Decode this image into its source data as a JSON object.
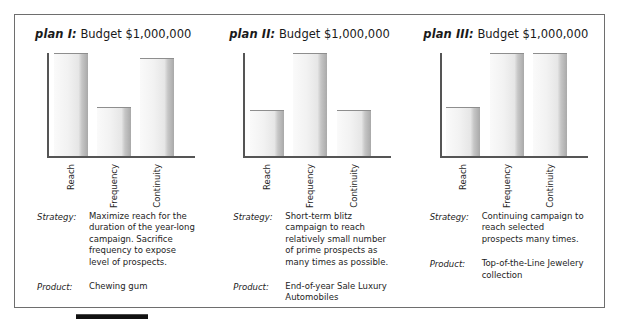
{
  "figure": {
    "caption_rule": "black-rule"
  },
  "chart_data": {
    "type": "bar",
    "categories": [
      "Reach",
      "Frequency",
      "Continuity"
    ],
    "xlabel": "",
    "ylabel": "",
    "ylim": [
      0,
      100
    ],
    "grid": false,
    "legend": "none",
    "series": [
      {
        "name": "plan I",
        "values": [
          100,
          48,
          95
        ]
      },
      {
        "name": "plan II",
        "values": [
          45,
          100,
          45
        ]
      },
      {
        "name": "plan III",
        "values": [
          48,
          100,
          100
        ]
      }
    ]
  },
  "panels": [
    {
      "plan_label": "plan I:",
      "budget": "Budget $1,000,000",
      "bars": [
        {
          "category": "Reach",
          "value": 100
        },
        {
          "category": "Frequency",
          "value": 48
        },
        {
          "category": "Continuity",
          "value": 95
        }
      ],
      "strategy_key": "Strategy:",
      "strategy_value": "Maximize reach for the duration of the year-long campaign. Sacrifice frequency to expose level of prospects.",
      "product_key": "Product:",
      "product_value": "Chewing gum"
    },
    {
      "plan_label": "plan II:",
      "budget": "Budget $1,000,000",
      "bars": [
        {
          "category": "Reach",
          "value": 45
        },
        {
          "category": "Frequency",
          "value": 100
        },
        {
          "category": "Continuity",
          "value": 45
        }
      ],
      "strategy_key": "Strategy:",
      "strategy_value": "Short-term blitz campaign to reach relatively small number of prime prospects as many times as possible.",
      "product_key": "Product:",
      "product_value": "End-of-year Sale Luxury Automobiles"
    },
    {
      "plan_label": "plan III:",
      "budget": "Budget $1,000,000",
      "bars": [
        {
          "category": "Reach",
          "value": 48
        },
        {
          "category": "Frequency",
          "value": 100
        },
        {
          "category": "Continuity",
          "value": 100
        }
      ],
      "strategy_key": "Strategy:",
      "strategy_value": "Continuing campaign to reach selected prospects many times.",
      "product_key": "Product:",
      "product_value": "Top-of-the-Line Jewelery collection"
    }
  ],
  "colors": {
    "frame_border": "#6e6e6e",
    "axis": "#555555",
    "bar_face": "#f0f0f0",
    "bar_shadow": "#a9a9a9",
    "text": "#1a1a1a",
    "rule": "#111111"
  }
}
